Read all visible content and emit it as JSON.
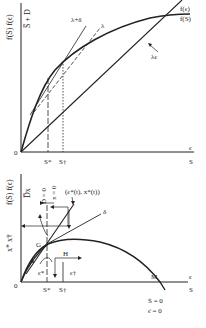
{
  "top_panel": {
    "y_axis_label": "f(S) f(ϵ)",
    "y_tick_label": "S̅ + D",
    "x_axis_label_eps": "ϵ",
    "x_axis_label_S": "S",
    "origin": "0",
    "s_star": "S*",
    "s_dagger": "S†",
    "line_lambda_delta": "λ+δ",
    "line_lambda": "λ",
    "line_lambda_eps": "λϵ",
    "curve_f_eps": "f(ϵ)",
    "curve_f_S": "f(S)"
  },
  "bottom_panel": {
    "y_axis_label": "f(S) f(ϵ)",
    "y_axis_label2": "x* x†",
    "y_tick_label": "D̅x",
    "isocline_D": "D = 0",
    "isocline_x": "x = 0",
    "point_label": "(ϵ*(t), x*(t))",
    "line_delta": "δ",
    "region_G": "G",
    "region_H": "H",
    "eps_star": "ϵ*",
    "eps_dagger": "ϵ†",
    "point_M": "M",
    "x_axis_label_eps": "ϵ",
    "x_axis_label_S": "S",
    "origin": "0",
    "s_star": "S*",
    "s_dagger": "S†",
    "condition_S": "Ṡ = 0",
    "condition_eps": "ϵ̇ = 0"
  }
}
